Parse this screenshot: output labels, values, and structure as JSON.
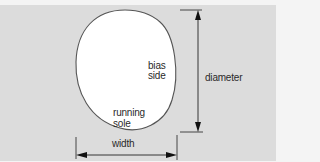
{
  "diagram": {
    "shape": "rounded oval (tire cross-section)",
    "labels": {
      "diameter": "diameter",
      "width": "width",
      "bias_side_line1": "bias",
      "bias_side_line2": "side",
      "running_sole_line1": "running",
      "running_sole_line2": "sole"
    },
    "colors": {
      "background": "#dcdcdc",
      "shape_fill": "#ffffff",
      "outline": "#555555",
      "arrow": "#222222",
      "text": "#2a2a2a"
    }
  }
}
